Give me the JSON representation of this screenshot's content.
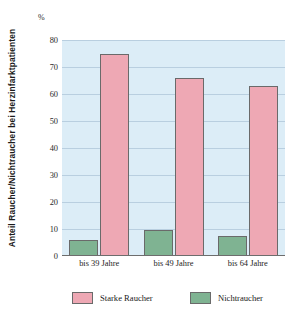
{
  "chart_data": {
    "type": "bar",
    "title": "",
    "subtitle": "",
    "xlabel": "",
    "ylabel": "Anteil Raucher/Nichtraucher bei Herzinfarktpatienten",
    "unit_label": "%",
    "categories": [
      "bis 39 Jahre",
      "bis 49 Jahre",
      "bis 64 Jahre"
    ],
    "series": [
      {
        "name": "Starke Raucher",
        "color": "#eea8b4",
        "values": [
          75,
          66,
          63
        ]
      },
      {
        "name": "Nichtraucher",
        "color": "#7fb392",
        "values": [
          6,
          9.5,
          7.5
        ]
      }
    ],
    "ylim": [
      0,
      80
    ],
    "yticks": [
      0,
      10,
      20,
      30,
      40,
      50,
      60,
      70,
      80
    ],
    "ytick_labels": [
      "0",
      "10",
      "20",
      "30",
      "40",
      "50",
      "60",
      "70",
      "80"
    ],
    "grid": true,
    "legend_position": "bottom",
    "plot_background": "#dcedf7",
    "page_background": "#ffffff"
  },
  "legend": {
    "items": [
      {
        "label": "Starke Raucher",
        "color": "#eea8b4"
      },
      {
        "label": "Nichtraucher",
        "color": "#7fb392"
      }
    ]
  }
}
